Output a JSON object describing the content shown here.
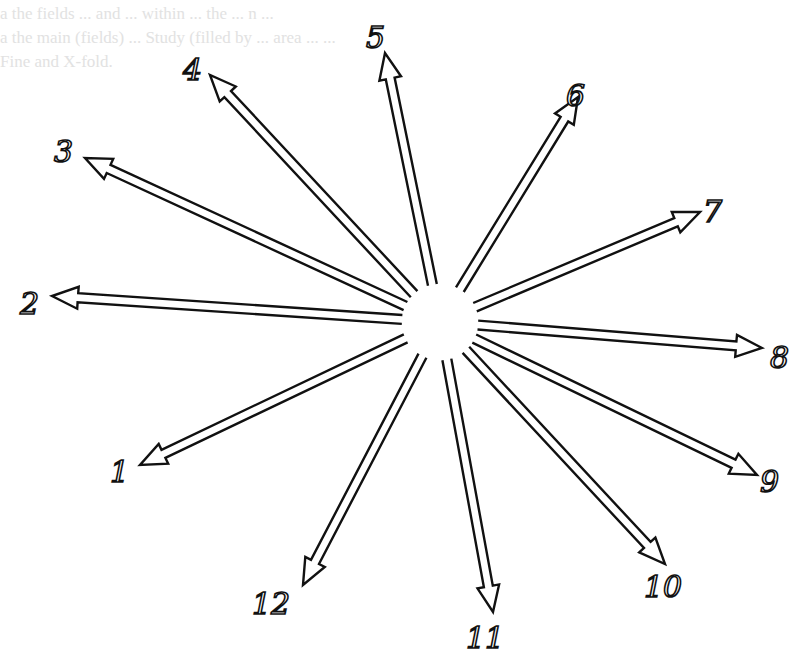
{
  "figure": {
    "center": {
      "x": 440,
      "y": 322
    },
    "center_gap_radius": 38,
    "stroke_color": "#111111",
    "background": "#ffffff",
    "arrows": [
      {
        "id": "1",
        "label": "1",
        "tip": {
          "x": 140,
          "y": 465
        },
        "label_pos": {
          "x": 110,
          "y": 482
        }
      },
      {
        "id": "2",
        "label": "2",
        "tip": {
          "x": 52,
          "y": 296
        },
        "label_pos": {
          "x": 20,
          "y": 314
        }
      },
      {
        "id": "3",
        "label": "3",
        "tip": {
          "x": 85,
          "y": 158
        },
        "label_pos": {
          "x": 54,
          "y": 162
        }
      },
      {
        "id": "4",
        "label": "4",
        "tip": {
          "x": 210,
          "y": 75
        },
        "label_pos": {
          "x": 183,
          "y": 80
        }
      },
      {
        "id": "5",
        "label": "5",
        "tip": {
          "x": 385,
          "y": 53
        },
        "label_pos": {
          "x": 366,
          "y": 48
        }
      },
      {
        "id": "6",
        "label": "6",
        "tip": {
          "x": 578,
          "y": 97
        },
        "label_pos": {
          "x": 566,
          "y": 106
        }
      },
      {
        "id": "7",
        "label": "7",
        "tip": {
          "x": 700,
          "y": 212
        },
        "label_pos": {
          "x": 703,
          "y": 222
        }
      },
      {
        "id": "8",
        "label": "8",
        "tip": {
          "x": 762,
          "y": 348
        },
        "label_pos": {
          "x": 770,
          "y": 368
        }
      },
      {
        "id": "9",
        "label": "9",
        "tip": {
          "x": 757,
          "y": 475
        },
        "label_pos": {
          "x": 760,
          "y": 492
        }
      },
      {
        "id": "10",
        "label": "10",
        "tip": {
          "x": 665,
          "y": 564
        },
        "label_pos": {
          "x": 644,
          "y": 597
        }
      },
      {
        "id": "11",
        "label": "11",
        "tip": {
          "x": 493,
          "y": 612
        },
        "label_pos": {
          "x": 466,
          "y": 648
        }
      },
      {
        "id": "12",
        "label": "12",
        "tip": {
          "x": 303,
          "y": 585
        },
        "label_pos": {
          "x": 252,
          "y": 614
        }
      }
    ]
  },
  "bleed_through": [
    {
      "text": "a   the   fields   ...   and   ...   within   ...   the   ...   n   ...",
      "y": 4
    },
    {
      "text": "a  the  main  (fields)  ...  Study  (filled  by  ...  area  ...  ...",
      "y": 28
    },
    {
      "text": "Fine  and  X-fold.",
      "y": 52
    }
  ]
}
